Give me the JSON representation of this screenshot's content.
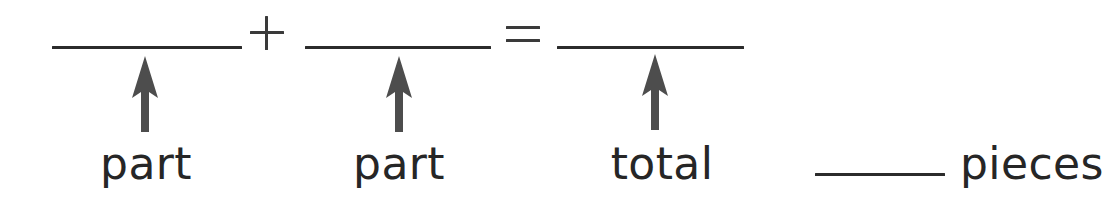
{
  "worksheet": {
    "type": "part-part-total-number-sentence",
    "colors": {
      "ink": "#262626",
      "rule": "#2b2b2b",
      "operator": "#3a3a3a",
      "arrow": "#4d4d4d",
      "background": "#ffffff"
    },
    "equation": {
      "blanks": [
        {
          "id": "addend-1",
          "label": "part"
        },
        {
          "id": "addend-2",
          "label": "part"
        },
        {
          "id": "sum",
          "label": "total"
        }
      ],
      "operators": [
        {
          "id": "plus",
          "symbol": "+",
          "name": "plus-sign"
        },
        {
          "id": "equals",
          "symbol": "=",
          "name": "equals-sign"
        }
      ]
    },
    "answer_line": {
      "blank_value": "",
      "unit_label": "pieces"
    },
    "arrows": [
      {
        "id": "arrow-part-1",
        "points_to": "addend-1",
        "direction": "up"
      },
      {
        "id": "arrow-part-2",
        "points_to": "addend-2",
        "direction": "up"
      },
      {
        "id": "arrow-total",
        "points_to": "sum",
        "direction": "up"
      }
    ]
  }
}
